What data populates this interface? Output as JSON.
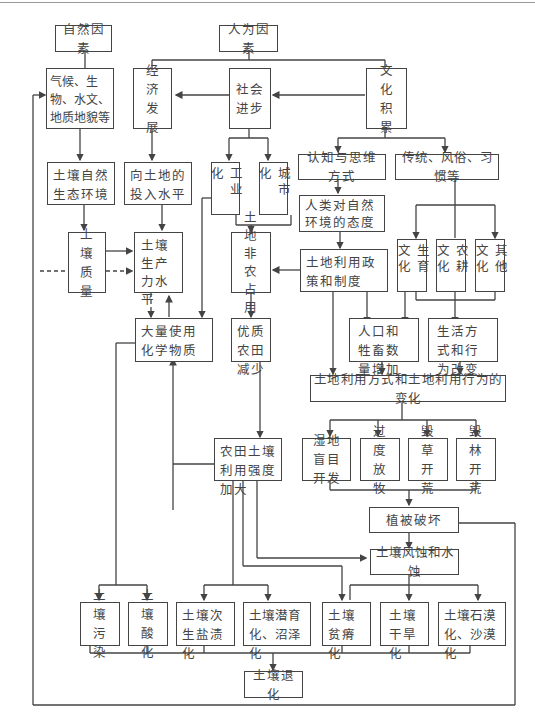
{
  "nodes": {
    "natural_factors": "自然因素",
    "human_factors": "人为因素",
    "natural_elements": "气候、生物、水文、地质地貌等",
    "economic_dev": "经济发展",
    "social_progress": "社会进步",
    "cultural_accum": "文化积累",
    "soil_natural_env": "土壤自然生态环境",
    "land_input": "向土地的投入水平",
    "industrialization": "工业化",
    "urbanization": "城市化",
    "cognition": "认知与思维方式",
    "traditions": "传统、风俗、习惯等",
    "attitude": "人类对自然环境的态度",
    "soil_quality": "土壤质量",
    "soil_productivity": "土壤生产力水平",
    "land_nonagri": "土地非农占用",
    "land_policy": "土地利用政策和制度",
    "fertility_culture": "生育文化",
    "farming_culture": "农耕文化",
    "other_culture": "其他文化",
    "chemicals": "大量使用化学物质",
    "farmland_decrease": "优质农田减少",
    "population_increase": "人口和牲畜数量增加",
    "lifestyle_change": "生活方式和行为改变",
    "land_use_change": "土地利用方式和土地利用行为的变化",
    "farmland_intensity": "农田土壤利用强度加大",
    "wetland_dev": "湿地盲目开发",
    "overgrazing": "过度放牧",
    "grass_destroy": "毁草开荒",
    "forest_destroy": "毁林开荒",
    "vegetation_damage": "植被破坏",
    "erosion": "土壤风蚀和水蚀",
    "pollution": "土壤污染",
    "acidification": "土壤酸化",
    "salinization": "土壤次生盐渍化",
    "gleization": "土壤潜育化、沼泽化",
    "impoverishment": "土壤贫瘠化",
    "drought": "土壤干旱化",
    "desertification": "土壤石漠化、沙漠化",
    "degradation": "土壤退化"
  }
}
